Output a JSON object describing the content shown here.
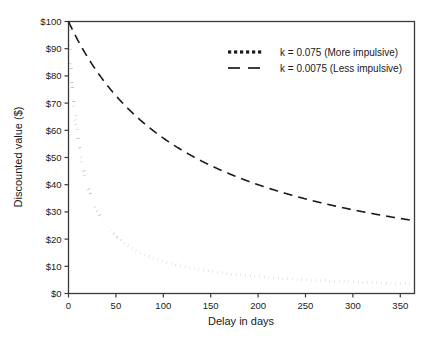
{
  "chart_data": {
    "type": "line",
    "title": "",
    "xlabel": "Delay in days",
    "ylabel": "Discounted value ($)",
    "xlim": [
      0,
      365
    ],
    "ylim": [
      0,
      100
    ],
    "xticks": [
      0,
      50,
      100,
      150,
      200,
      250,
      300,
      350
    ],
    "xticklabels": [
      "0",
      "50",
      "100",
      "150",
      "200",
      "250",
      "300",
      "350"
    ],
    "yticks": [
      0,
      10,
      20,
      30,
      40,
      50,
      60,
      70,
      80,
      90,
      100
    ],
    "yticklabels": [
      "$0",
      "$10",
      "$20",
      "$30",
      "$40",
      "$50",
      "$60",
      "$70",
      "$80",
      "$90",
      "$100"
    ],
    "grid": false,
    "legend_position": "upper right",
    "model": "V = A / (1 + k * D)",
    "amount": 100,
    "series": [
      {
        "name": "k = 0.075 (More impulsive)",
        "k": 0.075,
        "style": "dotted",
        "color": "#1a1a1a",
        "x": [
          0,
          5,
          10,
          15,
          20,
          25,
          30,
          40,
          50,
          60,
          75,
          90,
          100,
          120,
          150,
          180,
          200,
          250,
          300,
          330,
          365
        ],
        "y": [
          100.0,
          72.7,
          57.1,
          47.1,
          40.0,
          34.8,
          30.8,
          25.0,
          21.1,
          18.2,
          15.1,
          12.9,
          11.8,
          10.0,
          8.2,
          6.9,
          6.3,
          5.1,
          4.3,
          3.9,
          3.5
        ]
      },
      {
        "name": "k = 0.0075 (Less impulsive)",
        "k": 0.0075,
        "style": "dashed",
        "color": "#1a1a1a",
        "x": [
          0,
          10,
          20,
          30,
          50,
          75,
          100,
          125,
          150,
          175,
          200,
          225,
          250,
          275,
          300,
          330,
          365
        ],
        "y": [
          100.0,
          93.0,
          87.0,
          81.6,
          72.7,
          64.0,
          57.1,
          51.6,
          47.1,
          43.2,
          40.0,
          37.2,
          34.8,
          32.7,
          30.8,
          28.7,
          26.7
        ]
      }
    ]
  },
  "legend": {
    "entries": [
      {
        "label": "k = 0.075 (More impulsive)",
        "marker": "dotted-line-marker"
      },
      {
        "label": "k = 0.0075 (Less impulsive)",
        "marker": "dashed-line-marker"
      }
    ]
  },
  "axes": {
    "x_title": "Delay in days",
    "y_title": "Discounted value ($)"
  },
  "colors": {
    "background": "#ffffff",
    "ink": "#1a1a1a",
    "frame": "#3a3a3a"
  }
}
